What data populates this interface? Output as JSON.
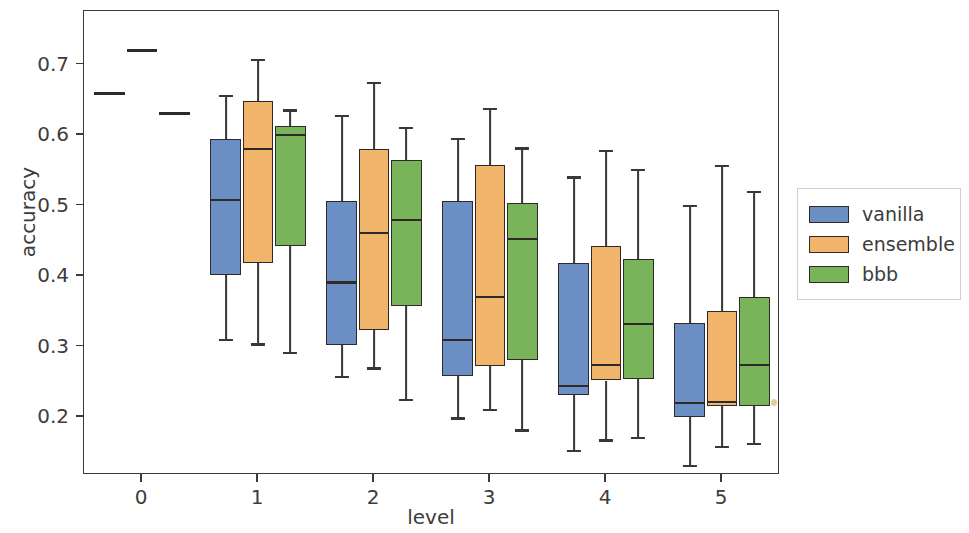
{
  "chart_data": {
    "type": "box",
    "title": "",
    "xlabel": "level",
    "ylabel": "accuracy",
    "grid": false,
    "legend_position": "right",
    "xlim": [
      -0.5,
      5.5
    ],
    "ylim": [
      0.118,
      0.776
    ],
    "categories": [
      "0",
      "1",
      "2",
      "3",
      "4",
      "5"
    ],
    "ytick_labels": [
      "0.7",
      "0.6",
      "0.5",
      "0.4",
      "0.3",
      "0.2"
    ],
    "ytick_values": [
      0.7,
      0.6,
      0.5,
      0.4,
      0.3,
      0.2
    ],
    "xtick_labels": [
      "0",
      "1",
      "2",
      "3",
      "4",
      "5"
    ],
    "colors": {
      "vanilla": "#6b8fc4",
      "ensemble": "#f0b46a",
      "bbb": "#79b45a",
      "edge": "#2f2a27",
      "axis": "#3a3a3a",
      "text": "#3c3c3c",
      "background": "#ffffff"
    },
    "series": [
      {
        "name": "vanilla",
        "color": "#6b8fc4",
        "boxes": [
          {
            "level": "0",
            "degenerate": true,
            "value": 0.659,
            "whisker_low": 0.659,
            "q1": 0.659,
            "median": 0.659,
            "q3": 0.659,
            "whisker_high": 0.659
          },
          {
            "level": "1",
            "degenerate": false,
            "whisker_low": 0.31,
            "q1": 0.402,
            "median": 0.508,
            "q3": 0.595,
            "whisker_high": 0.656
          },
          {
            "level": "2",
            "degenerate": false,
            "whisker_low": 0.257,
            "q1": 0.303,
            "median": 0.391,
            "q3": 0.506,
            "whisker_high": 0.627
          },
          {
            "level": "3",
            "degenerate": false,
            "whisker_low": 0.198,
            "q1": 0.259,
            "median": 0.31,
            "q3": 0.507,
            "whisker_high": 0.594
          },
          {
            "level": "4",
            "degenerate": false,
            "whisker_low": 0.152,
            "q1": 0.231,
            "median": 0.244,
            "q3": 0.419,
            "whisker_high": 0.54
          },
          {
            "level": "5",
            "degenerate": false,
            "whisker_low": 0.131,
            "q1": 0.2,
            "median": 0.22,
            "q3": 0.334,
            "whisker_high": 0.5
          }
        ]
      },
      {
        "name": "ensemble",
        "color": "#f0b46a",
        "boxes": [
          {
            "level": "0",
            "degenerate": true,
            "value": 0.72,
            "whisker_low": 0.72,
            "q1": 0.72,
            "median": 0.72,
            "q3": 0.72,
            "whisker_high": 0.72
          },
          {
            "level": "1",
            "degenerate": false,
            "whisker_low": 0.303,
            "q1": 0.418,
            "median": 0.58,
            "q3": 0.648,
            "whisker_high": 0.706
          },
          {
            "level": "2",
            "degenerate": false,
            "whisker_low": 0.269,
            "q1": 0.324,
            "median": 0.461,
            "q3": 0.58,
            "whisker_high": 0.674
          },
          {
            "level": "3",
            "degenerate": false,
            "whisker_low": 0.21,
            "q1": 0.272,
            "median": 0.37,
            "q3": 0.557,
            "whisker_high": 0.637
          },
          {
            "level": "4",
            "degenerate": false,
            "whisker_low": 0.167,
            "q1": 0.252,
            "median": 0.274,
            "q3": 0.443,
            "whisker_high": 0.578
          },
          {
            "level": "5",
            "degenerate": false,
            "whisker_low": 0.158,
            "q1": 0.216,
            "median": 0.221,
            "q3": 0.351,
            "whisker_high": 0.556
          }
        ]
      },
      {
        "name": "bbb",
        "color": "#79b45a",
        "boxes": [
          {
            "level": "0",
            "degenerate": true,
            "value": 0.631,
            "whisker_low": 0.631,
            "q1": 0.631,
            "median": 0.631,
            "q3": 0.631,
            "whisker_high": 0.631
          },
          {
            "level": "1",
            "degenerate": false,
            "whisker_low": 0.291,
            "q1": 0.443,
            "median": 0.6,
            "q3": 0.613,
            "whisker_high": 0.635
          },
          {
            "level": "2",
            "degenerate": false,
            "whisker_low": 0.224,
            "q1": 0.357,
            "median": 0.48,
            "q3": 0.565,
            "whisker_high": 0.61
          },
          {
            "level": "3",
            "degenerate": false,
            "whisker_low": 0.181,
            "q1": 0.281,
            "median": 0.453,
            "q3": 0.504,
            "whisker_high": 0.581
          },
          {
            "level": "4",
            "degenerate": false,
            "whisker_low": 0.17,
            "q1": 0.254,
            "median": 0.332,
            "q3": 0.424,
            "whisker_high": 0.551
          },
          {
            "level": "5",
            "degenerate": false,
            "whisker_low": 0.162,
            "q1": 0.216,
            "median": 0.274,
            "q3": 0.371,
            "whisker_high": 0.519
          }
        ]
      }
    ]
  },
  "legend": {
    "items": [
      {
        "label": "vanilla",
        "color": "#6b8fc4"
      },
      {
        "label": "ensemble",
        "color": "#f0b46a"
      },
      {
        "label": "bbb",
        "color": "#79b45a"
      }
    ]
  }
}
